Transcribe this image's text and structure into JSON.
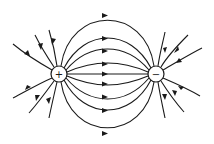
{
  "diagram": {
    "charges": [
      {
        "label": "+",
        "name": "positive-charge",
        "cx": 59,
        "cy": 74,
        "r": 8
      },
      {
        "label": "−",
        "name": "negative-charge",
        "cx": 156,
        "cy": 74,
        "r": 8
      }
    ],
    "colors": {
      "line": "#1a1a1a",
      "background": "#ffffff"
    }
  }
}
